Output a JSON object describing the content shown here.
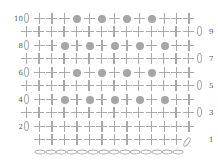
{
  "chart_title": "",
  "colors": {
    "stitch": "#a9a9a9",
    "bobble": "#a6a6a6",
    "label": "#555555"
  },
  "legend": {
    "+": "single crochet",
    "o": "bobble / puff stitch",
    "0": "chain (turning)",
    "foundation": "foundation chain"
  },
  "rows": [
    {
      "num": "10",
      "label_side": "left",
      "y": 19,
      "turn": "left",
      "stitches": "+++o+o+o+o+++"
    },
    {
      "num": "9",
      "label_side": "right",
      "y": 32,
      "turn": "right",
      "stitches": "++++++++++++++"
    },
    {
      "num": "8",
      "label_side": "left",
      "y": 46,
      "turn": "left",
      "stitches": "++o+o+o+o+o++"
    },
    {
      "num": "7",
      "label_side": "right",
      "y": 59,
      "turn": "right",
      "stitches": "++++++++++++++"
    },
    {
      "num": "6",
      "label_side": "left",
      "y": 73,
      "turn": "left",
      "stitches": "+++o+o+o+o+++"
    },
    {
      "num": "5",
      "label_side": "right",
      "y": 86,
      "turn": "right",
      "stitches": "++++++++++++++"
    },
    {
      "num": "4",
      "label_side": "left",
      "y": 100,
      "turn": "left",
      "stitches": "++o+o+o+o+o++"
    },
    {
      "num": "3",
      "label_side": "right",
      "y": 113,
      "turn": "right",
      "stitches": "++++++++++++++"
    },
    {
      "num": "2",
      "label_side": "left",
      "y": 127,
      "turn": "left",
      "stitches": "+++++++++++++"
    },
    {
      "num": "1",
      "label_side": "right",
      "y": 140,
      "turn": "rise",
      "stitches": "++++++++++++"
    }
  ],
  "foundation": {
    "y": 152,
    "count": 14
  },
  "chart_data": {
    "type": "table",
    "row_labels": [
      "10",
      "9",
      "8",
      "7",
      "6",
      "5",
      "4",
      "3",
      "2",
      "1"
    ],
    "symbols": {
      "+": "single crochet",
      "o": "bobble",
      "0": "turning chain"
    },
    "rows": [
      "0 + + + o + o + o + o + + +",
      "+ + + + + + + + + + + + + + 0",
      "0 + + o + o + o + o + o + +",
      "+ + + + + + + + + + + + + + 0",
      "0 + + + o + o + o + o + + +",
      "+ + + + + + + + + + + + + + 0",
      "0 + + o + o + o + o + o + +",
      "+ + + + + + + + + + + + + + 0",
      "0 + + + + + + + + + + + + +",
      "+ + + + + + + + + + + + 0"
    ],
    "foundation_chain_count": 14
  }
}
